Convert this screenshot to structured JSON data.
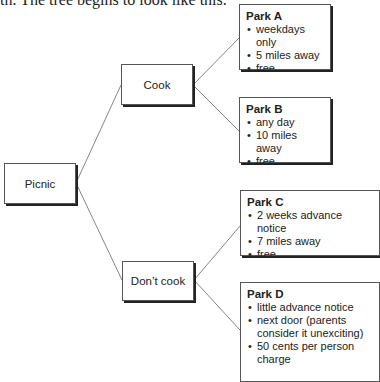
{
  "lead_text": "th. The tree begins to look like this.",
  "tree": {
    "root": {
      "label": "Picnic"
    },
    "branches": [
      {
        "label": "Cook"
      },
      {
        "label": "Don’t cook"
      }
    ],
    "parks": [
      {
        "title": "Park A",
        "items": [
          "weekdays only",
          "5 miles away",
          "free"
        ]
      },
      {
        "title": "Park B",
        "items": [
          "any day",
          "10 miles away",
          "free"
        ]
      },
      {
        "title": "Park C",
        "items": [
          "2 weeks advance notice",
          "7 miles away",
          "free"
        ]
      },
      {
        "title": "Park D",
        "items": [
          "little advance notice",
          "next door (parents consider it unexciting)",
          "50 cents per person charge"
        ]
      }
    ]
  }
}
